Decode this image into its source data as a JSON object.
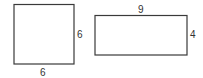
{
  "diagram": {
    "shapes": [
      {
        "id": "square",
        "type": "square",
        "labels": {
          "right": "6",
          "bottom": "6"
        }
      },
      {
        "id": "rectangle",
        "type": "rectangle",
        "labels": {
          "top": "9",
          "right": "4"
        }
      }
    ],
    "colors": {
      "stroke": "#3a3a3a",
      "text": "#333333",
      "background": "#ffffff"
    }
  }
}
